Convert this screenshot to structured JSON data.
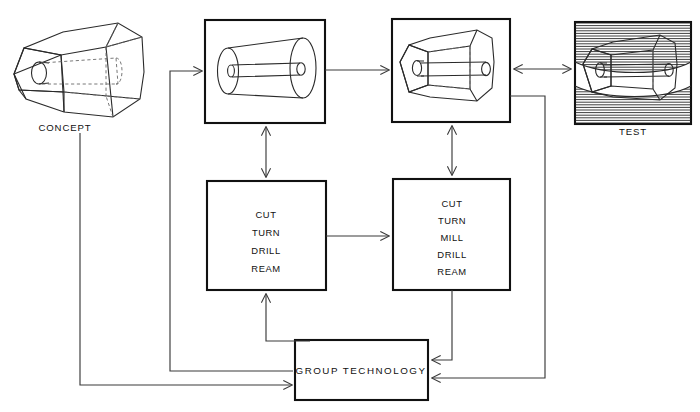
{
  "diagram": {
    "stroke_color": "#111111",
    "connector_color": "#3a3a3a",
    "background": "#ffffff"
  },
  "nodes": {
    "concept": {
      "caption": "CONCEPT",
      "shape": "hexagonal-tapered-prism-with-bore",
      "framed": false
    },
    "design_part": {
      "caption": "",
      "shape": "conical-part-with-through-bore",
      "framed": true
    },
    "machined_part": {
      "caption": "",
      "shape": "faceted-tapered-part-with-through-bore",
      "framed": true
    },
    "test": {
      "caption": "TEST",
      "shape": "part-between-hatched-fixture-jaws",
      "framed": true
    },
    "process_left": {
      "operations": [
        "CUT",
        "TURN",
        "DRILL",
        "REAM"
      ]
    },
    "process_right": {
      "operations": [
        "CUT",
        "TURN",
        "MILL",
        "DRILL",
        "REAM"
      ]
    },
    "group_technology": {
      "label": "GROUP TECHNOLOGY"
    }
  },
  "connections": [
    {
      "name": "concept-to-group-technology",
      "from": "concept",
      "to": "group_technology",
      "style": "solid-arrow"
    },
    {
      "name": "group-technology-to-design-part",
      "from": "group_technology",
      "to": "design_part",
      "style": "solid-arrow"
    },
    {
      "name": "design-part-to-machined-part",
      "from": "design_part",
      "to": "machined_part",
      "style": "solid-arrow"
    },
    {
      "name": "machined-part-to-test",
      "from": "machined_part",
      "to": "test",
      "style": "double-arrow"
    },
    {
      "name": "design-part-to-process-left",
      "from": "design_part",
      "to": "process_left",
      "style": "double-arrow-vertical"
    },
    {
      "name": "machined-part-to-process-right",
      "from": "machined_part",
      "to": "process_right",
      "style": "double-arrow-vertical"
    },
    {
      "name": "process-left-to-process-right",
      "from": "process_left",
      "to": "process_right",
      "style": "solid-arrow"
    },
    {
      "name": "group-technology-to-process-left",
      "from": "group_technology",
      "to": "process_left",
      "style": "solid-arrow"
    },
    {
      "name": "process-right-to-group-technology",
      "from": "process_right",
      "to": "group_technology",
      "style": "solid-arrow"
    },
    {
      "name": "test-to-group-technology",
      "from": "test",
      "to": "group_technology",
      "style": "solid-arrow"
    }
  ]
}
